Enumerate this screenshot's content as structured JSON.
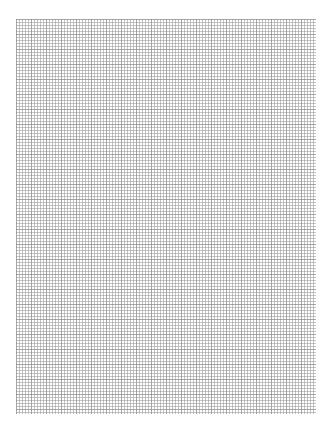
{
  "page": {
    "type": "grid-paper",
    "background_color": "#ffffff",
    "grid": {
      "line_color": "#969696",
      "minor_spacing_px": 3,
      "major_spacing_px": 15,
      "left": 16,
      "top": 19,
      "width": 300,
      "height": 395
    }
  },
  "footer": {
    "left_text": "",
    "right_text": ""
  }
}
